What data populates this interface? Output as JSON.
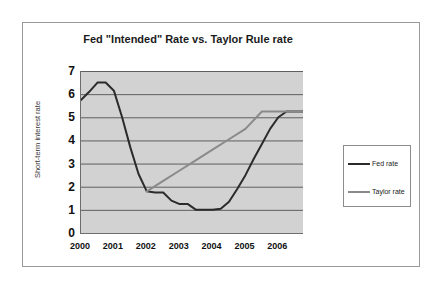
{
  "chart_data": {
    "type": "line",
    "title": "Fed \"Intended\" Rate vs. Taylor Rule rate",
    "xlabel": "",
    "ylabel": "Short-term interest rate",
    "xlim": [
      2000,
      2006.75
    ],
    "ylim": [
      0,
      7
    ],
    "grid": true,
    "grid_axis": "y",
    "legend_position": "right",
    "x_tick_labels": [
      "2000",
      "2001",
      "2002",
      "2003",
      "2004",
      "2005",
      "2006"
    ],
    "x_tick_values": [
      2000,
      2001,
      2002,
      2003,
      2004,
      2005,
      2006
    ],
    "y_tick_labels": [
      "7",
      "6",
      "5",
      "4",
      "3",
      "2",
      "1",
      "0"
    ],
    "y_tick_values": [
      7,
      6,
      5,
      4,
      3,
      2,
      1,
      0
    ],
    "minor_tick_interval": 0.25,
    "series": [
      {
        "name": "Fed rate",
        "color": "#2b2b2b",
        "x": [
          2000.0,
          2000.25,
          2000.5,
          2000.75,
          2001.0,
          2001.25,
          2001.5,
          2001.75,
          2002.0,
          2002.25,
          2002.5,
          2002.75,
          2003.0,
          2003.25,
          2003.5,
          2003.75,
          2004.0,
          2004.25,
          2004.5,
          2004.75,
          2005.0,
          2005.25,
          2005.5,
          2005.75,
          2006.0,
          2006.25,
          2006.5,
          2006.75
        ],
        "values": [
          5.75,
          6.1,
          6.5,
          6.5,
          6.15,
          5.0,
          3.7,
          2.55,
          1.8,
          1.75,
          1.75,
          1.4,
          1.25,
          1.25,
          1.0,
          1.0,
          1.0,
          1.05,
          1.35,
          1.9,
          2.5,
          3.2,
          3.85,
          4.5,
          5.0,
          5.25,
          5.25,
          5.25
        ]
      },
      {
        "name": "Taylor rate",
        "color": "#8a8a8a",
        "x": [
          2002.0,
          2002.5,
          2003.0,
          2003.5,
          2004.0,
          2004.5,
          2005.0,
          2005.5,
          2006.0,
          2006.5,
          2006.75
        ],
        "values": [
          1.8,
          2.25,
          2.7,
          3.15,
          3.6,
          4.05,
          4.5,
          5.25,
          5.25,
          5.25,
          5.25
        ]
      }
    ]
  },
  "legend": {
    "items": [
      {
        "label": "Fed rate",
        "color": "#2b2b2b"
      },
      {
        "label": "Taylor rate",
        "color": "#8a8a8a"
      }
    ]
  },
  "colors": {
    "plot_background": "#d2d2d2",
    "gridline": "#5f5f5f",
    "axis": "#6e6e6e",
    "figure_border": "#9a9a9a",
    "legend_border": "#8c8c8c"
  }
}
